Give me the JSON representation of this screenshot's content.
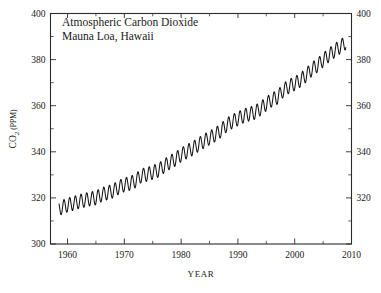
{
  "chart_data": {
    "type": "line",
    "title": "Atmospheric Carbon Dioxide",
    "subtitle": "Mauna Loa, Hawaii",
    "xlabel": "YEAR",
    "ylabel": "CO2 (PPM)",
    "ylabel_parts": {
      "main": "CO",
      "subscript": "2",
      "units": " (PPM)"
    },
    "xlim": [
      1957,
      2010
    ],
    "ylim": [
      300,
      400
    ],
    "grid": false,
    "legend": null,
    "x_major_ticks": [
      1960,
      1970,
      1980,
      1990,
      2000,
      2010
    ],
    "x_major_tick_labels": [
      "1960",
      "1970",
      "1980",
      "1990",
      "2000",
      "2010"
    ],
    "x_minor_ticks": [
      1965,
      1975,
      1985,
      1995,
      2005
    ],
    "y_major_ticks": [
      300,
      320,
      340,
      360,
      380,
      400
    ],
    "y_major_tick_labels": [
      "300",
      "320",
      "340",
      "360",
      "380",
      "400"
    ],
    "y_right_tick_labels": [
      "320",
      "340",
      "360",
      "380",
      "400"
    ],
    "y_minor_ticks": [
      310,
      330,
      350,
      370,
      390
    ],
    "seasonal_amplitude_ppm": 3.0,
    "line_color": "#141414",
    "background_color": "#ffffff",
    "series": [
      {
        "name": "Monthly mean CO2",
        "x": [
          1958.5,
          1959,
          1960,
          1961,
          1962,
          1963,
          1964,
          1965,
          1966,
          1967,
          1968,
          1969,
          1970,
          1971,
          1972,
          1973,
          1974,
          1975,
          1976,
          1977,
          1978,
          1979,
          1980,
          1981,
          1982,
          1983,
          1984,
          1985,
          1986,
          1987,
          1988,
          1989,
          1990,
          1991,
          1992,
          1993,
          1994,
          1995,
          1996,
          1997,
          1998,
          1999,
          2000,
          2001,
          2002,
          2003,
          2004,
          2005,
          2006,
          2007,
          2008,
          2009
        ],
        "values": [
          315.2,
          315.9,
          316.9,
          317.6,
          318.4,
          319.0,
          319.6,
          320.0,
          321.4,
          322.2,
          323.0,
          324.6,
          325.7,
          326.3,
          327.5,
          329.7,
          330.2,
          331.1,
          332.0,
          333.8,
          335.4,
          336.8,
          338.7,
          340.1,
          341.4,
          343.0,
          344.6,
          346.0,
          347.4,
          349.2,
          351.6,
          353.1,
          354.4,
          355.6,
          356.4,
          357.1,
          358.8,
          360.8,
          362.6,
          363.7,
          366.7,
          368.4,
          369.6,
          371.1,
          373.2,
          375.8,
          377.5,
          379.8,
          381.9,
          383.8,
          385.6,
          387.4
        ]
      }
    ]
  },
  "figure": {
    "title_line_1": "Atmospheric Carbon Dioxide",
    "title_line_2": "Mauna Loa, Hawaii",
    "xaxis_title": "YEAR"
  }
}
